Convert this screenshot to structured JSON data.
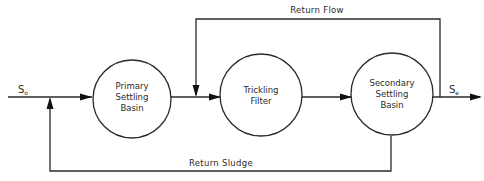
{
  "diagram": {
    "type": "process-flow",
    "nodes": [
      {
        "id": "primary",
        "lines": [
          "Primary",
          "Settling",
          "Basin"
        ]
      },
      {
        "id": "trickling",
        "lines": [
          "Trickling",
          "Filter"
        ]
      },
      {
        "id": "secondary",
        "lines": [
          "Secondary",
          "Settling",
          "Basin"
        ]
      }
    ],
    "edges": [
      {
        "from": "input",
        "to": "primary"
      },
      {
        "from": "primary",
        "to": "trickling"
      },
      {
        "from": "trickling",
        "to": "secondary"
      },
      {
        "from": "secondary",
        "to": "output"
      },
      {
        "from": "secondary",
        "to": "trickling-inlet",
        "label": "Return Flow"
      },
      {
        "from": "secondary",
        "to": "primary-inlet",
        "label": "Return Sludge"
      }
    ],
    "input": {
      "symbol": "S",
      "subscript": "o"
    },
    "output": {
      "symbol": "S",
      "subscript": "e"
    },
    "labels": {
      "return_flow": "Return Flow",
      "return_sludge": "Return Sludge"
    },
    "colors": {
      "stroke": "#2a2a2a",
      "background": "#ffffff"
    }
  }
}
